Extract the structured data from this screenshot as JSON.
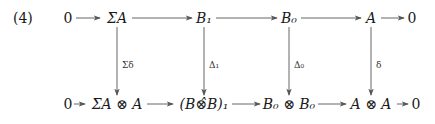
{
  "equation_number": "(4)",
  "top_row": [
    {
      "id": "t0",
      "label": "0"
    },
    {
      "id": "t1",
      "label": "ΣA"
    },
    {
      "id": "t2",
      "label": "B₁"
    },
    {
      "id": "t3",
      "label": "B₀"
    },
    {
      "id": "t4",
      "label": "A"
    },
    {
      "id": "t5",
      "label": "0"
    }
  ],
  "bottom_row": [
    {
      "id": "b0",
      "label": "0"
    },
    {
      "id": "b1",
      "label": "ΣA ⊗ A"
    },
    {
      "id": "b2",
      "label": "(B⊗̂B)₁"
    },
    {
      "id": "b3",
      "label": "B₀ ⊗ B₀"
    },
    {
      "id": "b4",
      "label": "A ⊗ A"
    },
    {
      "id": "b5",
      "label": "0"
    }
  ],
  "vertical_maps": [
    {
      "from": "ΣA",
      "to": "ΣA ⊗ A",
      "label": "Σδ"
    },
    {
      "from": "B₁",
      "to": "(B⊗̂B)₁",
      "label": "Δ₁"
    },
    {
      "from": "B₀",
      "to": "B₀ ⊗ B₀",
      "label": "Δ₀"
    },
    {
      "from": "A",
      "to": "A ⊗ A",
      "label": "δ"
    }
  ],
  "colors": {
    "ink": "#1a1a1a",
    "arrow": "#555555",
    "background": "#ffffff"
  }
}
